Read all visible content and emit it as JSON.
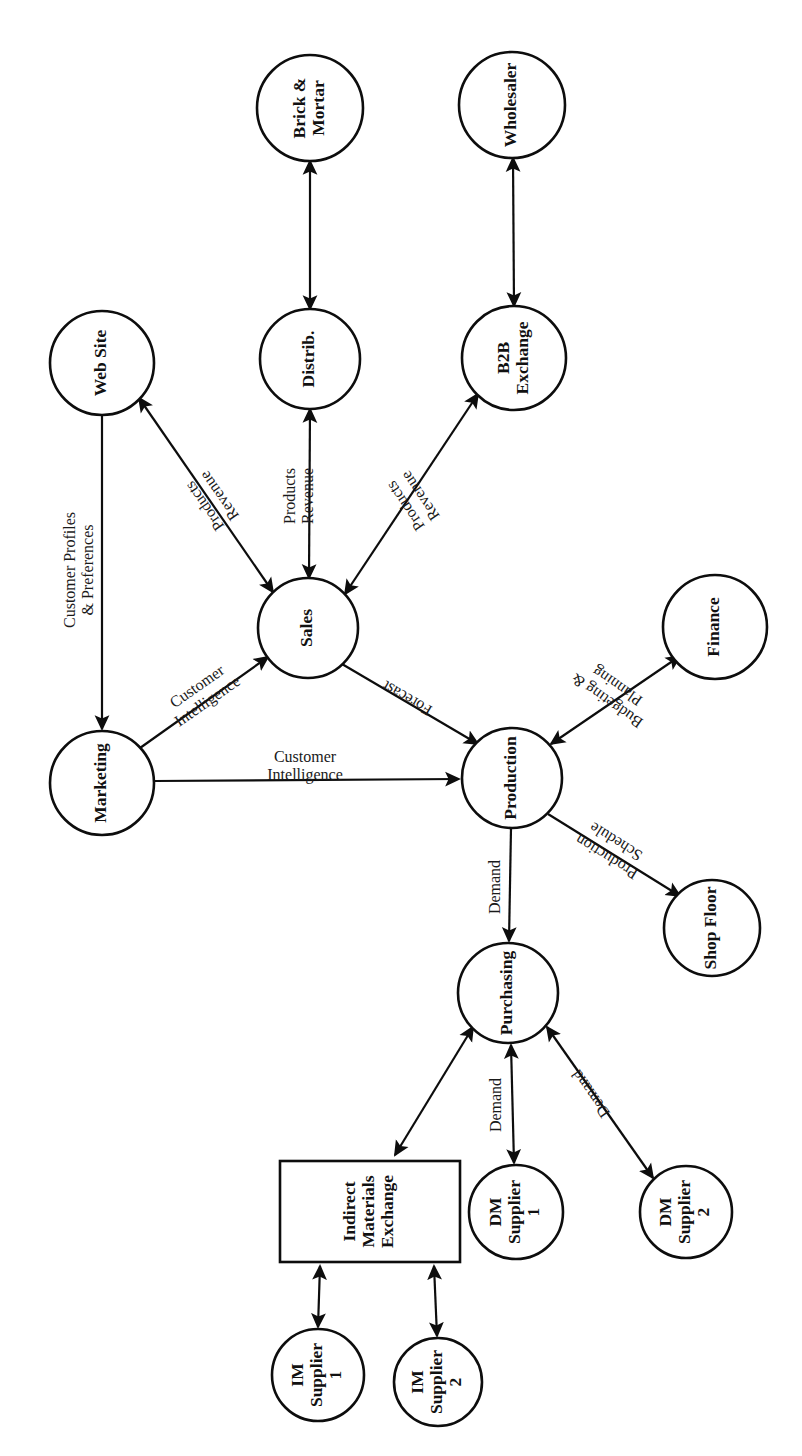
{
  "diagram": {
    "orientation": "rotated-90-ccw",
    "stroke_color": "#0d0d0d",
    "background_color": "#ffffff",
    "nodes": [
      {
        "id": "brick_mortar",
        "label_lines": [
          "Brick &",
          "Mortar"
        ],
        "shape": "circle",
        "cx": 310,
        "cy": 108,
        "r": 53
      },
      {
        "id": "wholesaler",
        "label_lines": [
          "Wholesaler"
        ],
        "shape": "circle",
        "cx": 512,
        "cy": 105,
        "r": 53
      },
      {
        "id": "web_site",
        "label_lines": [
          "Web Site"
        ],
        "shape": "circle",
        "cx": 102,
        "cy": 363,
        "r": 52
      },
      {
        "id": "distrib",
        "label_lines": [
          "Distrib."
        ],
        "shape": "circle",
        "cx": 310,
        "cy": 359,
        "r": 50
      },
      {
        "id": "b2b_exchange",
        "label_lines": [
          "B2B",
          "Exchange"
        ],
        "shape": "circle",
        "cx": 514,
        "cy": 358,
        "r": 52
      },
      {
        "id": "sales",
        "label_lines": [
          "Sales"
        ],
        "shape": "circle",
        "cx": 308,
        "cy": 628,
        "r": 50
      },
      {
        "id": "finance",
        "label_lines": [
          "Finance"
        ],
        "shape": "circle",
        "cx": 715,
        "cy": 627,
        "r": 52
      },
      {
        "id": "marketing",
        "label_lines": [
          "Marketing"
        ],
        "shape": "circle",
        "cx": 102,
        "cy": 783,
        "r": 52
      },
      {
        "id": "production",
        "label_lines": [
          "Production"
        ],
        "shape": "circle",
        "cx": 512,
        "cy": 778,
        "r": 50
      },
      {
        "id": "shop_floor",
        "label_lines": [
          "Shop Floor"
        ],
        "shape": "circle",
        "cx": 712,
        "cy": 928,
        "r": 48
      },
      {
        "id": "purchasing",
        "label_lines": [
          "Purchasing"
        ],
        "shape": "circle",
        "cx": 508,
        "cy": 993,
        "r": 50
      },
      {
        "id": "ime",
        "label_lines": [
          "Indirect",
          "Materials",
          "Exchange"
        ],
        "shape": "rect",
        "x": 280,
        "y": 1161,
        "width": 180,
        "height": 101
      },
      {
        "id": "dm_supplier_1",
        "label_lines": [
          "DM",
          "Supplier",
          "1"
        ],
        "shape": "circle",
        "cx": 516,
        "cy": 1212,
        "r": 47
      },
      {
        "id": "dm_supplier_2",
        "label_lines": [
          "DM",
          "Supplier",
          "2"
        ],
        "shape": "circle",
        "cx": 686,
        "cy": 1212,
        "r": 46
      },
      {
        "id": "im_supplier_1",
        "label_lines": [
          "IM",
          "Supplier",
          "1"
        ],
        "shape": "circle",
        "cx": 318,
        "cy": 1375,
        "r": 46
      },
      {
        "id": "im_supplier_2",
        "label_lines": [
          "IM",
          "Supplier",
          "2"
        ],
        "shape": "circle",
        "cx": 438,
        "cy": 1382,
        "r": 44
      }
    ],
    "edges": [
      {
        "id": "distrib_brick",
        "from": "distrib",
        "to": "brick_mortar",
        "arrows": "both",
        "label_lines": []
      },
      {
        "id": "b2b_wholesaler",
        "from": "b2b_exchange",
        "to": "wholesaler",
        "arrows": "both",
        "label_lines": []
      },
      {
        "id": "sales_web_site",
        "from": "sales",
        "to": "web_site",
        "arrows": "both",
        "label_lines": [
          "Products",
          "Revenue"
        ]
      },
      {
        "id": "sales_distrib",
        "from": "sales",
        "to": "distrib",
        "arrows": "both",
        "label_lines": [
          "Products",
          "Revenue"
        ]
      },
      {
        "id": "sales_b2b",
        "from": "sales",
        "to": "b2b_exchange",
        "arrows": "both",
        "label_lines": [
          "Products",
          "Revenue"
        ]
      },
      {
        "id": "web_site_marketing",
        "from": "web_site",
        "to": "marketing",
        "arrows": "forward",
        "label_lines": [
          "Customer Profiles",
          "& Preferences"
        ]
      },
      {
        "id": "marketing_sales",
        "from": "marketing",
        "to": "sales",
        "arrows": "forward",
        "label_lines": [
          "Customer",
          "Intelligence"
        ]
      },
      {
        "id": "marketing_production",
        "from": "marketing",
        "to": "production",
        "arrows": "forward",
        "label_lines": [
          "Customer",
          "Intelligence"
        ]
      },
      {
        "id": "sales_production",
        "from": "sales",
        "to": "production",
        "arrows": "forward",
        "label_lines": [
          "Forecast"
        ]
      },
      {
        "id": "production_finance",
        "from": "production",
        "to": "finance",
        "arrows": "both",
        "label_lines": [
          "Budgeting &",
          "Planning"
        ]
      },
      {
        "id": "production_shopfloor",
        "from": "production",
        "to": "shop_floor",
        "arrows": "forward",
        "label_lines": [
          "Production",
          "Schedule"
        ]
      },
      {
        "id": "production_purchase",
        "from": "production",
        "to": "purchasing",
        "arrows": "forward",
        "label_lines": [
          "Demand"
        ]
      },
      {
        "id": "purchasing_ime",
        "from": "purchasing",
        "to": "ime",
        "arrows": "both",
        "label_lines": []
      },
      {
        "id": "purchasing_dm1",
        "from": "purchasing",
        "to": "dm_supplier_1",
        "arrows": "both",
        "label_lines": [
          "Demand"
        ]
      },
      {
        "id": "purchasing_dm2",
        "from": "purchasing",
        "to": "dm_supplier_2",
        "arrows": "both",
        "label_lines": [
          "Demand"
        ]
      },
      {
        "id": "ime_im1",
        "from": "ime",
        "to": "im_supplier_1",
        "arrows": "both",
        "label_lines": []
      },
      {
        "id": "ime_im2",
        "from": "ime",
        "to": "im_supplier_2",
        "arrows": "both",
        "label_lines": []
      }
    ],
    "edge_geometry": {
      "distrib_brick": {
        "x1": 310,
        "y1": 309,
        "x2": 310,
        "y2": 161,
        "label_x": 0,
        "label_y": 0,
        "label_rot": 0
      },
      "b2b_wholesaler": {
        "x1": 514,
        "y1": 306,
        "x2": 513,
        "y2": 158,
        "label_x": 0,
        "label_y": 0,
        "label_rot": 0
      },
      "sales_web_site": {
        "x1": 273,
        "y1": 592,
        "x2": 139,
        "y2": 398,
        "label_x": 213,
        "label_y": 500,
        "label_rot": -125
      },
      "sales_distrib": {
        "x1": 309,
        "y1": 578,
        "x2": 310,
        "y2": 409,
        "label_x": 300,
        "label_y": 496,
        "label_rot": -90
      },
      "sales_b2b": {
        "x1": 345,
        "y1": 594,
        "x2": 478,
        "y2": 394,
        "label_x": 414,
        "label_y": 500,
        "label_rot": -124
      },
      "web_site_marketing": {
        "x1": 102,
        "y1": 415,
        "x2": 102,
        "y2": 729,
        "label_x": 80,
        "label_y": 570,
        "label_rot": -90
      },
      "marketing_sales": {
        "x1": 140,
        "y1": 748,
        "x2": 268,
        "y2": 657,
        "label_x": 203,
        "label_y": 695,
        "label_rot": -35
      },
      "marketing_production": {
        "x1": 154,
        "y1": 781,
        "x2": 459,
        "y2": 779,
        "label_x": 305,
        "label_y": 767,
        "label_rot": 0
      },
      "sales_production": {
        "x1": 342,
        "y1": 664,
        "x2": 478,
        "y2": 744,
        "label_x": 408,
        "label_y": 697,
        "label_rot": -150
      },
      "production_finance": {
        "x1": 551,
        "y1": 744,
        "x2": 680,
        "y2": 656,
        "label_x": 613,
        "label_y": 692,
        "label_rot": -145
      },
      "production_shopfloor": {
        "x1": 548,
        "y1": 814,
        "x2": 680,
        "y2": 896,
        "label_x": 612,
        "label_y": 848,
        "label_rot": -148
      },
      "production_purchase": {
        "x1": 511,
        "y1": 828,
        "x2": 509,
        "y2": 941,
        "label_x": 496,
        "label_y": 887,
        "label_rot": -90
      },
      "purchasing_ime": {
        "x1": 473,
        "y1": 1027,
        "x2": 395,
        "y2": 1155,
        "label_x": 0,
        "label_y": 0,
        "label_rot": 0
      },
      "purchasing_dm1": {
        "x1": 511,
        "y1": 1045,
        "x2": 514,
        "y2": 1163,
        "label_x": 497,
        "label_y": 1105,
        "label_rot": -90
      },
      "purchasing_dm2": {
        "x1": 547,
        "y1": 1027,
        "x2": 653,
        "y2": 1178,
        "label_x": 592,
        "label_y": 1093,
        "label_rot": -125
      },
      "ime_im1": {
        "x1": 320,
        "y1": 1266,
        "x2": 318,
        "y2": 1327,
        "label_x": 0,
        "label_y": 0,
        "label_rot": 0
      },
      "ime_im2": {
        "x1": 434,
        "y1": 1266,
        "x2": 437,
        "y2": 1336,
        "label_x": 0,
        "label_y": 0,
        "label_rot": 0
      }
    }
  }
}
